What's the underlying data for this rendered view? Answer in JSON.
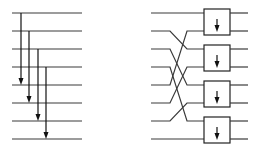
{
  "diagram": {
    "left": {
      "description": "8 horizontal lines with 4 long-distance downward arrows (stride 4 comparisons)",
      "line_x_start": 12,
      "line_x_end": 82,
      "lines_y": [
        13,
        31,
        49,
        67,
        85,
        103,
        121,
        139
      ],
      "arrows": [
        {
          "x": 21,
          "from_line": 0,
          "to_line": 4
        },
        {
          "x": 29,
          "from_line": 1,
          "to_line": 5
        },
        {
          "x": 38,
          "from_line": 2,
          "to_line": 6
        },
        {
          "x": 46,
          "from_line": 3,
          "to_line": 7
        }
      ]
    },
    "right": {
      "description": "Perfect-shuffle wiring of 8 inputs into 4 comparator boxes, each with a downward arrow",
      "input_x_start": 151,
      "shuffle_x_start": 170,
      "shuffle_x_end": 187,
      "box_x_start": 204,
      "box_x_end": 230,
      "output_x_end": 248,
      "lines_y": [
        13,
        31,
        49,
        67,
        85,
        103,
        121,
        139
      ],
      "shuffle_map": [
        0,
        2,
        4,
        6,
        1,
        3,
        5,
        7
      ],
      "boxes": [
        {
          "top_line": 0,
          "bottom_line": 1
        },
        {
          "top_line": 2,
          "bottom_line": 3
        },
        {
          "top_line": 4,
          "bottom_line": 5
        },
        {
          "top_line": 6,
          "bottom_line": 7
        }
      ]
    }
  },
  "colors": {
    "line": "#3a3a3a",
    "arrow": "#111111",
    "box_stroke": "#222222",
    "background": "#ffffff"
  }
}
